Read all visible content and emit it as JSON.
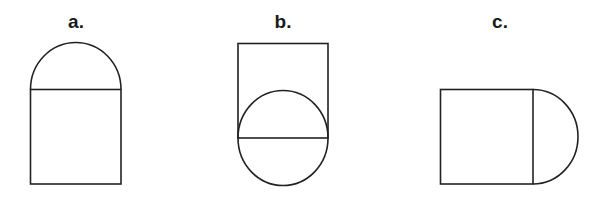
{
  "figures": [
    {
      "label": "a.",
      "description": "Square with semicircle attached on top"
    },
    {
      "label": "b.",
      "description": "Square with full circle centered on its bottom edge"
    },
    {
      "label": "c.",
      "description": "Square with semicircle attached on right side"
    }
  ]
}
